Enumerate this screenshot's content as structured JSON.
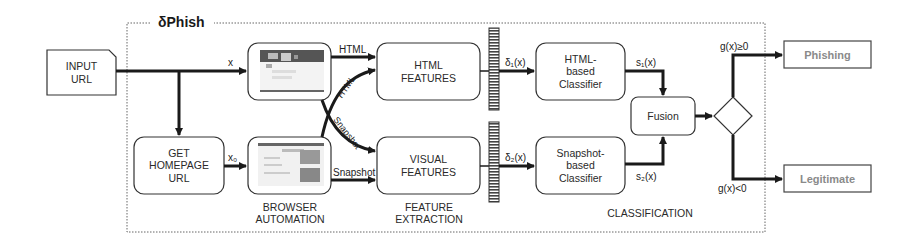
{
  "diagram": {
    "title": "δPhish",
    "input": {
      "label": "INPUT\nURL"
    },
    "get_homepage": {
      "label": "GET\nHOMEPAGE\nURL"
    },
    "edges": {
      "x": "x",
      "x0": "x₀",
      "html_top": "HTML",
      "html_diag": "HTML",
      "snapshot_diag": "Snapshot",
      "snapshot_bottom": "Snapshot",
      "delta1": "δ₁(x)",
      "delta2": "δ₂(x)",
      "s1": "s₁(x)",
      "s2": "s₂(x)",
      "g_pos": "g(x)≥0",
      "g_neg": "g(x)<0"
    },
    "feature_boxes": {
      "html": "HTML\nFEATURES",
      "visual": "VISUAL\nFEATURES"
    },
    "classifiers": {
      "html": "HTML-\nbased\nClassifier",
      "snapshot": "Snapshot-\nbased\nClassifier"
    },
    "fusion": "Fusion",
    "outputs": {
      "phishing": "Phishing",
      "legitimate": "Legitimate"
    },
    "section_labels": {
      "browser_automation": "BROWSER\nAUTOMATION",
      "feature_extraction": "FEATURE\nEXTRACTION",
      "classification": "CLASSIFICATION"
    },
    "colors": {
      "stroke": "#2a2a2a",
      "output_text": "#8a8a8a",
      "frame": "#555555"
    }
  }
}
